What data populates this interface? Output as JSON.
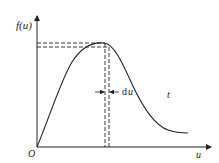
{
  "diagram": {
    "y_axis_label": "f(u)",
    "x_axis_label": "u",
    "origin_label": "O",
    "interval_label_d": "d",
    "interval_label_u": "u",
    "curve_label": "t",
    "colors": {
      "stroke": "#222222",
      "background": "#ffffff"
    }
  }
}
